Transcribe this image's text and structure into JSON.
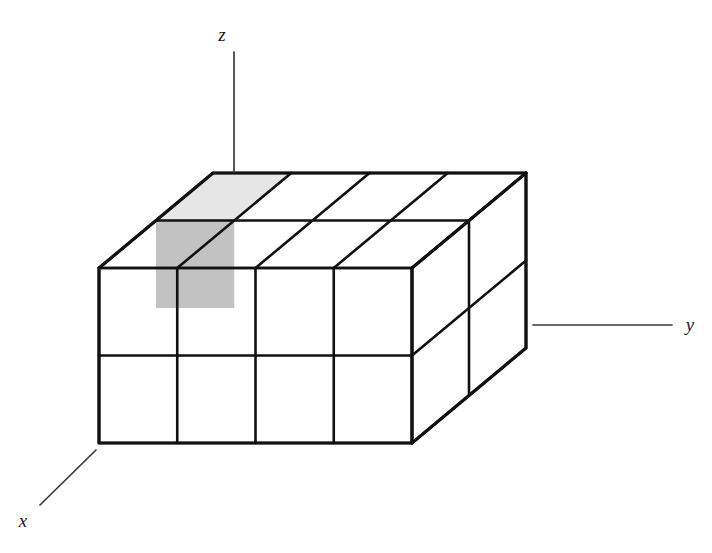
{
  "figure": {
    "background_color": "#ffffff",
    "line_color": "#111111",
    "axis_line_color": "#3a3a3a",
    "title": "",
    "caption": ""
  },
  "axes": [
    {
      "name": "z-axis",
      "label": "z",
      "label_x": 222,
      "label_y": 41,
      "line_x1": 234,
      "line_y1": 52,
      "line_x2": 234,
      "line_y2": 172
    },
    {
      "name": "y-axis",
      "label": "y",
      "label_x": 690,
      "label_y": 331,
      "line_x1": 533,
      "line_y1": 325,
      "line_x2": 672,
      "line_y2": 325
    },
    {
      "name": "x-axis",
      "label": "x",
      "label_x": 23,
      "label_y": 527,
      "line_x1": 96,
      "line_y1": 450,
      "line_x2": 40,
      "line_y2": 505
    }
  ],
  "block": {
    "description": "Axonometric rectangular block subdivided into unit cubes",
    "grid": {
      "columns_y": 4,
      "rows_z": 2,
      "layers_x": 2
    },
    "front_face_origin": {
      "x": 99,
      "y": 268
    },
    "cell_width": 78.25,
    "cell_height": 87.5,
    "depth_dx": 114,
    "depth_dy": -95,
    "highlighted_cell": {
      "name": "shaded-unit-cube",
      "column": 1,
      "row": 1,
      "layer": 1,
      "front_fill": "#c2c2c2",
      "top_fill": "#e6e6e6"
    },
    "default_fill": "#ffffff",
    "stroke_width_outer": 3.2,
    "stroke_width_inner": 2.6
  }
}
